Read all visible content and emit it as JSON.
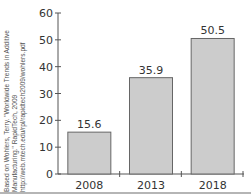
{
  "citation": {
    "lines": [
      "Based on Wohlers, Terry. \"Worldwide Trends in Additive",
      "Manufacturing.\" RapidTech, 2009",
      "http://web.mtech.edu/rpl/rapidtech2009/wohlers.pdf"
    ]
  },
  "chart_data": {
    "type": "bar",
    "title": "",
    "xlabel": "",
    "ylabel": "",
    "categories": [
      "2008",
      "2013",
      "2018"
    ],
    "values": [
      15.6,
      35.9,
      50.5
    ],
    "data_labels": [
      "15.6",
      "35.9",
      "50.5"
    ],
    "ylim": [
      0,
      60
    ],
    "yticks": [
      0,
      10,
      20,
      30,
      40,
      50,
      60
    ],
    "grid": false,
    "legend": null,
    "bar_color": "#cccccc",
    "bar_edge_color": "#666666"
  },
  "colors": {
    "axis": "#555555",
    "text": "#333333",
    "rule": "#b5b5b5"
  }
}
